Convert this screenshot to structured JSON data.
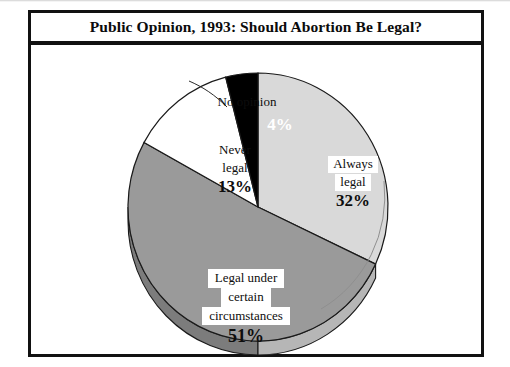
{
  "figure": {
    "title": "Public Opinion, 1993: Should Abortion Be Legal?",
    "source_credit": ""
  },
  "colors": {
    "always_legal": "#d9d9d9",
    "legal_certain": "#9a9a9a",
    "never_legal": "#ffffff",
    "no_opinion": "#000000",
    "outline": "#1a1a1a",
    "depth_always_legal": "#b6b6b6",
    "depth_legal_certain": "#7c7c7c",
    "frame": "#111111",
    "background": "#ffffff"
  },
  "labels": {
    "no_opinion": {
      "category": "No opinion",
      "percent": "4%"
    },
    "never_legal": {
      "category_line1": "Never",
      "category_line2": "legal",
      "percent": "13%"
    },
    "always_legal": {
      "category_line1": "Always",
      "category_line2": "legal",
      "percent": "32%"
    },
    "legal_certain": {
      "category_line1": "Legal under",
      "category_line2": "certain",
      "category_line3": "circumstances",
      "percent": "51%"
    }
  },
  "chart_data": {
    "type": "pie",
    "title": "Public Opinion, 1993: Should Abortion Be Legal?",
    "xlabel": "",
    "ylabel": "",
    "units": "percent",
    "total": 100,
    "start_angle_deg": 0,
    "direction": "clockwise",
    "legend_position": "none (direct slice labels)",
    "grid": false,
    "categories": [
      "Always legal",
      "Legal under certain circumstances",
      "Never legal",
      "No opinion"
    ],
    "values": [
      32,
      51,
      13,
      4
    ],
    "slices": [
      {
        "label": "Always legal",
        "value": 32,
        "display": "32%",
        "color": "#d9d9d9",
        "start_deg": 0,
        "end_deg": 115.2
      },
      {
        "label": "Legal under certain circumstances",
        "value": 51,
        "display": "51%",
        "color": "#9a9a9a",
        "start_deg": 115.2,
        "end_deg": 298.8
      },
      {
        "label": "Never legal",
        "value": 13,
        "display": "13%",
        "color": "#ffffff",
        "start_deg": 298.8,
        "end_deg": 345.6
      },
      {
        "label": "No opinion",
        "value": 4,
        "display": "4%",
        "color": "#000000",
        "start_deg": 345.6,
        "end_deg": 360
      }
    ]
  }
}
